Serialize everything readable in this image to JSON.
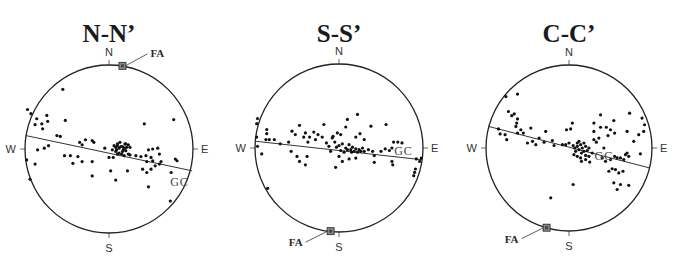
{
  "chart_data": [
    {
      "type": "scatter",
      "title": "N-N’",
      "directions": {
        "north": "N",
        "south": "S",
        "east": "E",
        "west": "W"
      },
      "great_circle_label": "GC",
      "fold_axis_label": "FA",
      "units": "normalized stereonet coordinates (x: W=-1 to E=1, y: S=-1 to N=1)",
      "fold_axis": [
        0.16,
        0.99
      ],
      "great_circle": [
        [
          -0.99,
          0.16
        ],
        [
          0.99,
          -0.26
        ]
      ],
      "points": [
        [
          -0.97,
          0.47
        ],
        [
          -0.93,
          0.42
        ],
        [
          -0.86,
          0.36
        ],
        [
          -0.8,
          0.3
        ],
        [
          -0.74,
          0.4
        ],
        [
          -0.73,
          0.33
        ],
        [
          -0.88,
          0.29
        ],
        [
          -0.79,
          0.24
        ],
        [
          -0.55,
          0.71
        ],
        [
          -0.52,
          0.34
        ],
        [
          -0.62,
          0.16
        ],
        [
          -0.58,
          0.15
        ],
        [
          -0.35,
          0.08
        ],
        [
          -0.32,
          0.05
        ],
        [
          -0.28,
          0.11
        ],
        [
          -0.77,
          0.01
        ],
        [
          -0.72,
          0.04
        ],
        [
          -0.53,
          -0.08
        ],
        [
          -0.46,
          -0.08
        ],
        [
          -0.37,
          -0.09
        ],
        [
          -0.32,
          -0.15
        ],
        [
          -0.2,
          -0.15
        ],
        [
          -0.43,
          -0.17
        ],
        [
          -0.98,
          -0.13
        ],
        [
          -0.88,
          -0.18
        ],
        [
          -0.94,
          -0.36
        ],
        [
          -0.2,
          -0.32
        ],
        [
          -0.85,
          -0.01
        ],
        [
          -0.2,
          0.1
        ],
        [
          -0.18,
          0.08
        ],
        [
          -0.05,
          0.01
        ],
        [
          0.04,
          -0.01
        ],
        [
          0.08,
          -0.03
        ],
        [
          0.16,
          0.03
        ],
        [
          0.2,
          -0.02
        ],
        [
          0.23,
          -0.06
        ],
        [
          0.06,
          0.04
        ],
        [
          0.1,
          0.04
        ],
        [
          0.12,
          0.01
        ],
        [
          0.14,
          0.03
        ],
        [
          0.17,
          -0.01
        ],
        [
          0.09,
          -0.01
        ],
        [
          0.12,
          -0.05
        ],
        [
          0.15,
          -0.06
        ],
        [
          0.18,
          0.01
        ],
        [
          0.21,
          0.02
        ],
        [
          0.13,
          0.08
        ],
        [
          0.19,
          0.06
        ],
        [
          0.23,
          0.05
        ],
        [
          0.1,
          0.06
        ],
        [
          0.08,
          0.02
        ],
        [
          0.16,
          -0.03
        ],
        [
          0.2,
          0.06
        ],
        [
          0.25,
          0.02
        ],
        [
          0.0,
          -0.1
        ],
        [
          0.05,
          -0.1
        ],
        [
          0.1,
          -0.06
        ],
        [
          0.18,
          -0.08
        ],
        [
          0.25,
          -0.07
        ],
        [
          0.32,
          -0.08
        ],
        [
          0.38,
          -0.09
        ],
        [
          0.44,
          -0.08
        ],
        [
          0.5,
          -0.1
        ],
        [
          0.52,
          -0.14
        ],
        [
          0.45,
          -0.15
        ],
        [
          0.55,
          -0.2
        ],
        [
          0.6,
          -0.18
        ],
        [
          0.62,
          -0.15
        ],
        [
          0.47,
          -0.01
        ],
        [
          0.52,
          0.0
        ],
        [
          0.58,
          0.01
        ],
        [
          0.6,
          -0.06
        ],
        [
          0.5,
          -0.24
        ],
        [
          0.4,
          -0.24
        ],
        [
          0.45,
          -0.28
        ],
        [
          0.02,
          -0.26
        ],
        [
          0.22,
          -0.26
        ],
        [
          0.42,
          0.3
        ],
        [
          0.77,
          0.35
        ],
        [
          0.79,
          -0.12
        ],
        [
          0.81,
          -0.14
        ],
        [
          0.74,
          -0.28
        ],
        [
          0.47,
          -0.45
        ],
        [
          0.73,
          -0.62
        ],
        [
          0.08,
          -0.37
        ]
      ]
    },
    {
      "type": "scatter",
      "title": "S-S’",
      "directions": {
        "north": "N",
        "south": "S",
        "east": "E",
        "west": "W"
      },
      "great_circle_label": "GC",
      "fold_axis_label": "FA",
      "units": "normalized stereonet coordinates (x: W=-1 to E=1, y: S=-1 to N=1)",
      "fold_axis": [
        -0.1,
        -0.99
      ],
      "great_circle": [
        [
          -0.99,
          0.08
        ],
        [
          0.99,
          -0.14
        ]
      ],
      "points": [
        [
          -0.98,
          0.29
        ],
        [
          -0.97,
          0.35
        ],
        [
          -0.98,
          0.13
        ],
        [
          -0.97,
          0.02
        ],
        [
          -0.92,
          -0.07
        ],
        [
          -0.86,
          0.22
        ],
        [
          -0.86,
          0.17
        ],
        [
          -0.87,
          0.1
        ],
        [
          -0.83,
          0.1
        ],
        [
          -0.77,
          0.1
        ],
        [
          -0.7,
          0.05
        ],
        [
          -0.6,
          0.07
        ],
        [
          -0.56,
          0.2
        ],
        [
          -0.52,
          0.16
        ],
        [
          -0.47,
          0.27
        ],
        [
          -0.42,
          0.13
        ],
        [
          -0.4,
          0.18
        ],
        [
          -0.37,
          0.07
        ],
        [
          -0.35,
          0.13
        ],
        [
          -0.3,
          0.19
        ],
        [
          -0.28,
          0.1
        ],
        [
          -0.25,
          0.16
        ],
        [
          -0.2,
          0.13
        ],
        [
          -0.18,
          0.28
        ],
        [
          -0.15,
          0.06
        ],
        [
          -0.12,
          0.02
        ],
        [
          -0.08,
          0.12
        ],
        [
          -0.07,
          0.14
        ],
        [
          -0.57,
          -0.04
        ],
        [
          -0.5,
          -0.1
        ],
        [
          -0.47,
          -0.16
        ],
        [
          -0.4,
          -0.2
        ],
        [
          -0.38,
          -0.1
        ],
        [
          -0.1,
          -0.04
        ],
        [
          -0.05,
          0.07
        ],
        [
          -0.03,
          0.01
        ],
        [
          0.0,
          0.03
        ],
        [
          0.02,
          -0.03
        ],
        [
          0.04,
          0.05
        ],
        [
          0.06,
          -0.05
        ],
        [
          0.08,
          0.0
        ],
        [
          0.1,
          -0.02
        ],
        [
          0.12,
          0.04
        ],
        [
          0.14,
          -0.02
        ],
        [
          0.15,
          -0.05
        ],
        [
          0.16,
          0.01
        ],
        [
          0.18,
          -0.04
        ],
        [
          0.2,
          -0.01
        ],
        [
          0.22,
          -0.05
        ],
        [
          0.24,
          -0.02
        ],
        [
          0.26,
          -0.04
        ],
        [
          0.28,
          0.0
        ],
        [
          0.3,
          -0.04
        ],
        [
          0.02,
          0.16
        ],
        [
          0.08,
          0.25
        ],
        [
          0.1,
          0.34
        ],
        [
          0.2,
          0.13
        ],
        [
          0.25,
          0.17
        ],
        [
          0.3,
          0.1
        ],
        [
          0.35,
          -0.02
        ],
        [
          0.4,
          -0.04
        ],
        [
          0.42,
          -0.09
        ],
        [
          0.2,
          -0.12
        ],
        [
          0.12,
          -0.13
        ],
        [
          0.0,
          -0.1
        ],
        [
          0.04,
          -0.16
        ],
        [
          -0.04,
          -0.23
        ],
        [
          0.5,
          -0.04
        ],
        [
          0.55,
          -0.01
        ],
        [
          0.6,
          -0.03
        ],
        [
          0.65,
          0.07
        ],
        [
          0.7,
          0.07
        ],
        [
          0.75,
          0.06
        ],
        [
          0.63,
          0.0
        ],
        [
          0.56,
          0.28
        ],
        [
          0.38,
          0.26
        ],
        [
          0.92,
          -0.13
        ],
        [
          0.96,
          -0.16
        ],
        [
          0.98,
          -0.12
        ],
        [
          0.91,
          -0.25
        ],
        [
          0.89,
          -0.33
        ],
        [
          0.9,
          -0.29
        ],
        [
          0.64,
          -0.2
        ],
        [
          0.63,
          -0.16
        ],
        [
          0.42,
          -0.17
        ],
        [
          -0.85,
          -0.48
        ],
        [
          0.22,
          0.4
        ],
        [
          -0.02,
          0.18
        ]
      ]
    },
    {
      "type": "scatter",
      "title": "C-C’",
      "directions": {
        "north": "N",
        "south": "S",
        "east": "E",
        "west": "W"
      },
      "great_circle_label": "GC",
      "fold_axis_label": "FA",
      "units": "normalized stereonet coordinates (x: W=-1 to E=1, y: S=-1 to N=1)",
      "fold_axis": [
        -0.27,
        -0.96
      ],
      "great_circle": [
        [
          -0.97,
          0.26
        ],
        [
          0.97,
          -0.24
        ]
      ],
      "points": [
        [
          -0.76,
          0.62
        ],
        [
          -0.62,
          0.65
        ],
        [
          -0.73,
          0.44
        ],
        [
          -0.69,
          0.39
        ],
        [
          -0.66,
          0.41
        ],
        [
          -0.62,
          0.35
        ],
        [
          -0.63,
          0.3
        ],
        [
          -0.64,
          0.26
        ],
        [
          -0.58,
          0.22
        ],
        [
          -0.62,
          0.18
        ],
        [
          -0.85,
          0.23
        ],
        [
          -0.83,
          0.17
        ],
        [
          -0.77,
          0.16
        ],
        [
          -0.75,
          0.1
        ],
        [
          -0.55,
          0.18
        ],
        [
          -0.46,
          0.24
        ],
        [
          -0.36,
          0.12
        ],
        [
          -0.28,
          0.2
        ],
        [
          -0.2,
          0.09
        ],
        [
          -0.18,
          0.03
        ],
        [
          -0.44,
          0.08
        ],
        [
          -0.5,
          0.06
        ],
        [
          -0.4,
          0.04
        ],
        [
          -0.3,
          0.07
        ],
        [
          -0.08,
          0.04
        ],
        [
          -0.04,
          0.04
        ],
        [
          0.0,
          0.06
        ],
        [
          0.04,
          0.3
        ],
        [
          -0.03,
          0.22
        ],
        [
          0.02,
          0.23
        ],
        [
          0.05,
          0.03
        ],
        [
          0.07,
          0.0
        ],
        [
          0.08,
          -0.04
        ],
        [
          0.1,
          0.02
        ],
        [
          0.12,
          -0.02
        ],
        [
          0.14,
          0.04
        ],
        [
          0.15,
          -0.06
        ],
        [
          0.16,
          0.0
        ],
        [
          0.18,
          -0.04
        ],
        [
          0.2,
          0.02
        ],
        [
          0.22,
          -0.03
        ],
        [
          0.24,
          0.0
        ],
        [
          0.1,
          0.06
        ],
        [
          0.12,
          0.08
        ],
        [
          0.18,
          0.06
        ],
        [
          0.06,
          -0.08
        ],
        [
          0.1,
          -0.1
        ],
        [
          0.14,
          -0.12
        ],
        [
          0.2,
          -0.09
        ],
        [
          0.24,
          -0.1
        ],
        [
          0.28,
          -0.06
        ],
        [
          0.3,
          0.1
        ],
        [
          0.33,
          0.07
        ],
        [
          0.36,
          0.12
        ],
        [
          0.3,
          0.2
        ],
        [
          0.38,
          0.25
        ],
        [
          0.45,
          0.25
        ],
        [
          0.5,
          0.22
        ],
        [
          0.47,
          0.15
        ],
        [
          0.55,
          0.18
        ],
        [
          0.42,
          0.0
        ],
        [
          0.4,
          -0.12
        ],
        [
          0.44,
          -0.16
        ],
        [
          0.5,
          -0.14
        ],
        [
          0.55,
          -0.1
        ],
        [
          0.58,
          -0.12
        ],
        [
          0.62,
          -0.12
        ],
        [
          0.66,
          -0.14
        ],
        [
          0.68,
          -0.08
        ],
        [
          0.7,
          -0.06
        ],
        [
          0.72,
          -0.1
        ],
        [
          0.56,
          -0.26
        ],
        [
          0.48,
          -0.28
        ],
        [
          0.6,
          -0.3
        ],
        [
          0.65,
          -0.28
        ],
        [
          0.7,
          0.2
        ],
        [
          0.78,
          0.08
        ],
        [
          0.84,
          0.16
        ],
        [
          0.9,
          0.2
        ],
        [
          0.91,
          0.28
        ],
        [
          0.88,
          0.36
        ],
        [
          0.73,
          0.42
        ],
        [
          0.54,
          0.33
        ],
        [
          0.86,
          -0.07
        ],
        [
          0.54,
          -0.42
        ],
        [
          0.62,
          -0.44
        ],
        [
          0.72,
          -0.45
        ],
        [
          0.58,
          -0.5
        ],
        [
          0.05,
          -0.44
        ],
        [
          0.52,
          -0.25
        ],
        [
          -0.22,
          -0.6
        ],
        [
          0.2,
          -0.14
        ],
        [
          0.25,
          -0.17
        ],
        [
          0.15,
          -0.16
        ],
        [
          0.3,
          0.3
        ],
        [
          0.38,
          0.4
        ]
      ]
    }
  ]
}
